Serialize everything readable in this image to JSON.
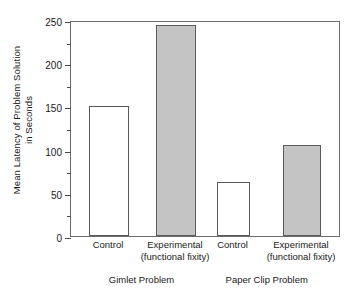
{
  "chart_data": {
    "type": "bar",
    "title": "",
    "xlabel": "",
    "ylabel": "Mean Latency of Problem Solution in Seconds",
    "ylabel_line1": "Mean Latency of Problem Solution",
    "ylabel_line2": "in Seconds",
    "ylim": [
      0,
      250
    ],
    "yticks": [
      0,
      50,
      100,
      150,
      200,
      250
    ],
    "ytick_labels": [
      "0",
      "50",
      "100",
      "150",
      "200",
      "250"
    ],
    "yminor_ticks": [
      25,
      75,
      125,
      175,
      225
    ],
    "grid": false,
    "legend": "none",
    "categories": [
      "Control",
      "Experimental (functional fixity)",
      "Control",
      "Experimental (functional fixity)"
    ],
    "values": [
      150,
      244,
      63,
      105
    ],
    "groups": [
      "Gimlet Problem",
      "Paper Clip Problem"
    ],
    "bars": [
      {
        "label_line1": "Control",
        "label_line2": "",
        "value": 150,
        "fill": "#ffffff",
        "group": "Gimlet Problem"
      },
      {
        "label_line1": "Experimental",
        "label_line2": "(functional fixity)",
        "value": 244,
        "fill": "#c4c4c4",
        "group": "Gimlet Problem"
      },
      {
        "label_line1": "Control",
        "label_line2": "",
        "value": 63,
        "fill": "#ffffff",
        "group": "Paper Clip Problem"
      },
      {
        "label_line1": "Experimental",
        "label_line2": "(functional fixity)",
        "value": 105,
        "fill": "#c4c4c4",
        "group": "Paper Clip Problem"
      }
    ],
    "colors": {
      "control_fill": "#ffffff",
      "experimental_fill": "#c4c4c4",
      "bar_outline": "#5a5a5a",
      "axis": "#6d6d6d",
      "text": "#1a1a1a"
    }
  }
}
